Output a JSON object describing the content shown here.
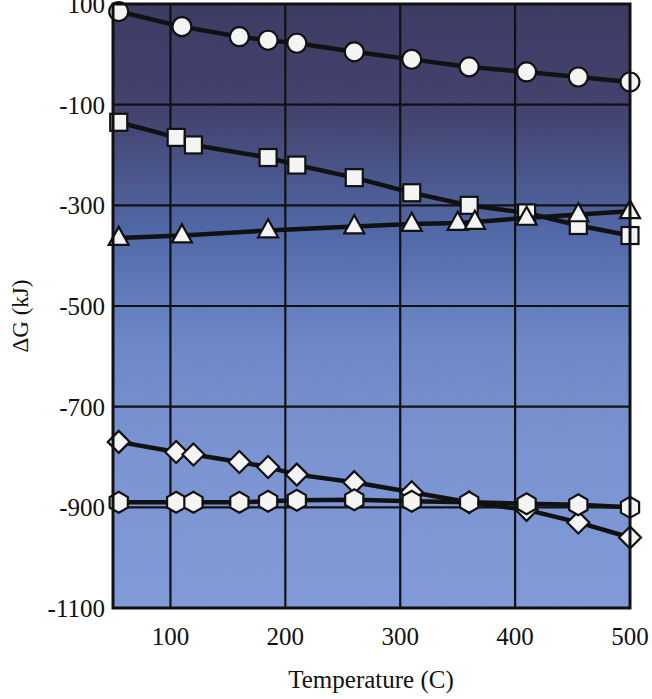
{
  "chart_data": {
    "type": "line",
    "title": "",
    "xlabel": "Temperature (C)",
    "ylabel": "ΔG (kJ)",
    "xlim": [
      50,
      500
    ],
    "ylim": [
      -1100,
      100
    ],
    "xticks": [
      100,
      200,
      300,
      400,
      500
    ],
    "yticks": [
      100,
      -100,
      -300,
      -500,
      -700,
      -900,
      -1100
    ],
    "xtick_labels": [
      "100",
      "200",
      "300",
      "400",
      "500"
    ],
    "ytick_labels": [
      "100",
      "-100",
      "-300",
      "-500",
      "-700",
      "-900",
      "-1100"
    ],
    "grid": true,
    "legend": "none",
    "plot_bg_gradient_top": "#3c3c66",
    "plot_bg_gradient_bottom": "#7e97d6",
    "line_color": "#111111",
    "marker_fill": "#f4f4f4",
    "marker_edge": "#111111",
    "series": [
      {
        "name": "circle-series",
        "marker": "circle",
        "x": [
          55,
          110,
          160,
          185,
          210,
          260,
          310,
          360,
          410,
          455,
          500
        ],
        "values": [
          85,
          55,
          35,
          28,
          22,
          5,
          -10,
          -25,
          -35,
          -45,
          -55
        ]
      },
      {
        "name": "square-series",
        "marker": "square",
        "x": [
          55,
          105,
          120,
          185,
          210,
          260,
          310,
          360,
          410,
          455,
          500
        ],
        "values": [
          -135,
          -165,
          -180,
          -205,
          -220,
          -245,
          -275,
          -300,
          -315,
          -340,
          -360
        ]
      },
      {
        "name": "triangle-series",
        "marker": "triangle",
        "x": [
          55,
          110,
          185,
          260,
          310,
          350,
          365,
          410,
          455,
          500
        ],
        "values": [
          -365,
          -360,
          -350,
          -342,
          -337,
          -335,
          -333,
          -325,
          -318,
          -312
        ]
      },
      {
        "name": "diamond-series",
        "marker": "diamond",
        "x": [
          55,
          105,
          120,
          160,
          185,
          210,
          260,
          310,
          360,
          410,
          455,
          500
        ],
        "values": [
          -770,
          -790,
          -795,
          -810,
          -820,
          -835,
          -850,
          -870,
          -890,
          -905,
          -930,
          -960
        ]
      },
      {
        "name": "hexagon-series",
        "marker": "hexagon",
        "x": [
          55,
          105,
          120,
          160,
          185,
          210,
          260,
          310,
          360,
          410,
          455,
          500
        ],
        "values": [
          -890,
          -890,
          -890,
          -890,
          -888,
          -886,
          -885,
          -888,
          -890,
          -893,
          -895,
          -900
        ]
      }
    ]
  },
  "axes": {
    "y_axis_title": "ΔG (kJ)",
    "x_axis_title": "Temperature (C)"
  }
}
